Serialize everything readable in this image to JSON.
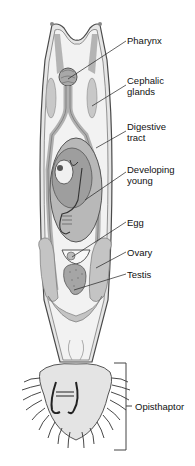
{
  "diagram": {
    "labels": [
      {
        "id": "pharynx",
        "text": "Pharynx",
        "x": 127,
        "y": 35
      },
      {
        "id": "cephalic-glands",
        "text": "Cephalic\nglands",
        "x": 127,
        "y": 75
      },
      {
        "id": "digestive-tract",
        "text": "Digestive\ntract",
        "x": 127,
        "y": 121
      },
      {
        "id": "developing-young",
        "text": "Developing\nyoung",
        "x": 127,
        "y": 164
      },
      {
        "id": "egg",
        "text": "Egg",
        "x": 127,
        "y": 217
      },
      {
        "id": "ovary",
        "text": "Ovary",
        "x": 127,
        "y": 247
      },
      {
        "id": "testis",
        "text": "Testis",
        "x": 127,
        "y": 269
      },
      {
        "id": "opisthaptor",
        "text": "Opisthaptor",
        "x": 135,
        "y": 402
      }
    ],
    "colors": {
      "outline": "#4a4a4a",
      "body_fill": "#e6e6e6",
      "inner_fill": "#f2f2f2",
      "organ_fill": "#bdbdbd",
      "young_fill": "#9e9e9e",
      "leader": "#222222"
    }
  }
}
